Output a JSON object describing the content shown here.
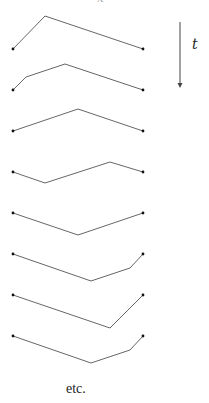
{
  "diagram": {
    "time_label": "t",
    "footer_label": "etc.",
    "top_fragment": "x",
    "colors": {
      "line": "#555555",
      "dot": "#111111",
      "arrow": "#444444"
    },
    "arrow": {
      "x": 180,
      "y1": 22,
      "y2": 88
    },
    "paths": [
      {
        "points": [
          [
            13,
            49
          ],
          [
            45,
            16
          ],
          [
            143,
            49
          ]
        ]
      },
      {
        "points": [
          [
            13,
            90
          ],
          [
            26,
            77
          ],
          [
            65,
            64
          ],
          [
            143,
            90
          ]
        ]
      },
      {
        "points": [
          [
            13,
            131
          ],
          [
            78,
            109
          ],
          [
            143,
            131
          ]
        ]
      },
      {
        "points": [
          [
            13,
            172
          ],
          [
            45,
            183
          ],
          [
            110,
            162
          ],
          [
            143,
            172
          ]
        ]
      },
      {
        "points": [
          [
            13,
            213
          ],
          [
            78,
            235
          ],
          [
            143,
            213
          ]
        ]
      },
      {
        "points": [
          [
            13,
            254
          ],
          [
            91,
            281
          ],
          [
            130,
            268
          ],
          [
            143,
            254
          ]
        ]
      },
      {
        "points": [
          [
            13,
            295
          ],
          [
            110,
            328
          ],
          [
            143,
            295
          ]
        ]
      },
      {
        "points": [
          [
            13,
            336
          ],
          [
            91,
            363
          ],
          [
            130,
            350
          ],
          [
            143,
            336
          ]
        ]
      }
    ]
  }
}
